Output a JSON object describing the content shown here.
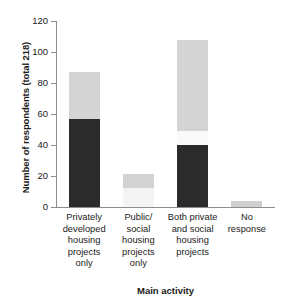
{
  "chart_data": {
    "type": "bar",
    "title": "",
    "subtitle": "",
    "xlabel": "Main activity",
    "ylabel": "Number of respondents (total 218)",
    "ylim": [
      0,
      120
    ],
    "yticks": [
      0,
      20,
      40,
      60,
      80,
      100,
      120
    ],
    "grid": false,
    "legend": "none",
    "stacked": true,
    "total_respondents": 218,
    "categories": [
      "Privately developed housing projects only",
      "Public/ social housing projects only",
      "Both private and social housing projects",
      "No response"
    ],
    "category_lines": [
      [
        "Privately",
        "developed",
        "housing",
        "projects",
        "only"
      ],
      [
        "Public/",
        "social",
        "housing",
        "projects",
        "only"
      ],
      [
        "Both private",
        "and social",
        "housing",
        "projects"
      ],
      [
        "No",
        "response"
      ]
    ],
    "series": [
      {
        "name": "dark-segment",
        "color": "#2b2b2b",
        "values": [
          57,
          0,
          40,
          0
        ]
      },
      {
        "name": "white-segment",
        "color": "#f7f7f7",
        "values": [
          0,
          12,
          9,
          0
        ]
      },
      {
        "name": "light-segment",
        "color": "#d4d4d4",
        "values": [
          30,
          9,
          59,
          4
        ]
      }
    ],
    "bar_totals": [
      87,
      21,
      108,
      4
    ],
    "bars": [
      {
        "category": "Privately developed housing projects only",
        "total": 87,
        "segments": [
          {
            "from": 0,
            "to": 57,
            "color": "#2b2b2b"
          },
          {
            "from": 57,
            "to": 87,
            "color": "#d4d4d4"
          }
        ]
      },
      {
        "category": "Public/ social housing projects only",
        "total": 21,
        "segments": [
          {
            "from": 0,
            "to": 12,
            "color": "#f4f4f4"
          },
          {
            "from": 12,
            "to": 21,
            "color": "#d2d2d2"
          }
        ]
      },
      {
        "category": "Both private and social housing projects",
        "total": 108,
        "segments": [
          {
            "from": 0,
            "to": 40,
            "color": "#2b2b2b"
          },
          {
            "from": 40,
            "to": 49,
            "color": "#fafafa"
          },
          {
            "from": 49,
            "to": 108,
            "color": "#d4d4d4"
          }
        ]
      },
      {
        "category": "No response",
        "total": 4,
        "segments": [
          {
            "from": 0,
            "to": 4,
            "color": "#d0d0d0"
          }
        ]
      }
    ]
  },
  "axis": {
    "y_tick_labels": [
      "0",
      "20",
      "40",
      "60",
      "80",
      "100",
      "120"
    ]
  }
}
